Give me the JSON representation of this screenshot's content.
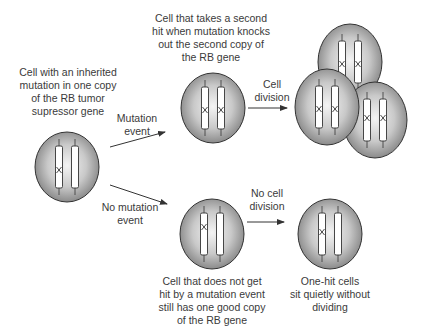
{
  "colors": {
    "cell_fill_center": "#f2f2f2",
    "cell_fill_edge": "#8a8a8a",
    "cell_stroke": "#333333",
    "text": "#3a3a3a",
    "arrow": "#333333"
  },
  "labels": {
    "start_cell": [
      "Cell with an inherited",
      "mutation in one copy",
      "of the RB tumor",
      "supressor gene"
    ],
    "mutation_event": [
      "Mutation",
      "event"
    ],
    "no_mutation_event": [
      "No mutation",
      "event"
    ],
    "second_hit_cell": [
      "Cell that takes a second",
      "hit when mutation knocks",
      "out the second copy of",
      "the RB gene"
    ],
    "cell_division": [
      "Cell",
      "division"
    ],
    "no_cell_division": [
      "No cell",
      "division"
    ],
    "no_hit_cell": [
      "Cell that does not get",
      "hit by a mutation event",
      "still has one good copy",
      "of the RB gene"
    ],
    "one_hit_cells": [
      "One-hit cells",
      "sit quietly without",
      "dividing"
    ]
  },
  "cells": [
    {
      "id": "start",
      "cx": 67,
      "cy": 167,
      "mutations": [
        true,
        false
      ]
    },
    {
      "id": "second-hit",
      "cx": 213,
      "cy": 108,
      "mutations": [
        true,
        true
      ]
    },
    {
      "id": "no-hit",
      "cx": 212,
      "cy": 234,
      "mutations": [
        true,
        false
      ]
    },
    {
      "id": "one-hit",
      "cx": 330,
      "cy": 234,
      "mutations": [
        true,
        false
      ]
    },
    {
      "id": "divided-back",
      "cx": 350,
      "cy": 62,
      "mutations": [
        true,
        true
      ]
    },
    {
      "id": "divided-right",
      "cx": 375,
      "cy": 120,
      "mutations": [
        true,
        true
      ]
    },
    {
      "id": "divided-front",
      "cx": 327,
      "cy": 107,
      "mutations": [
        true,
        true
      ]
    }
  ]
}
